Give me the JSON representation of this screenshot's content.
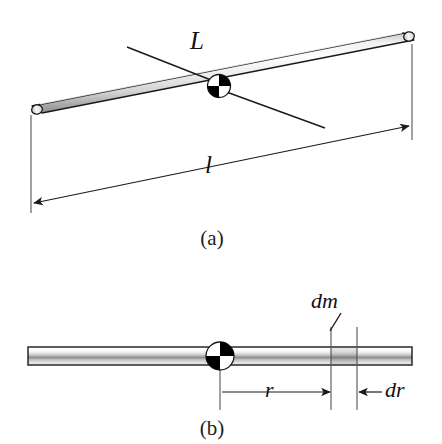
{
  "figure": {
    "background_color": "#ffffff",
    "line_color": "#1a1a1a",
    "rod_fill_light": "#fbfbfb",
    "rod_fill_mid": "#d8d8d8",
    "rod_fill_dark": "#9a9a9a",
    "pivot_fill_dark": "#000000",
    "pivot_fill_light": "#ffffff"
  },
  "panels": [
    {
      "id": "a",
      "caption": "(a)",
      "description": "Three-dimensional view of a thin uniform rod with a rotation axis through its center",
      "labels": [
        {
          "name": "axis-label",
          "text": "L"
        },
        {
          "name": "length-dimension-label",
          "text": "l"
        }
      ]
    },
    {
      "id": "b",
      "caption": "(b)",
      "description": "Side view of the rod showing mass element dm at distance r with width dr",
      "labels": [
        {
          "name": "mass-element-label",
          "text": "dm"
        },
        {
          "name": "radius-dimension-label",
          "text": "r"
        },
        {
          "name": "width-dimension-label",
          "text": "dr"
        }
      ]
    }
  ],
  "labels": {
    "L": "L",
    "l": "l",
    "dm": "dm",
    "r": "r",
    "dr": "dr",
    "caption_a": "(a)",
    "caption_b": "(b)"
  }
}
